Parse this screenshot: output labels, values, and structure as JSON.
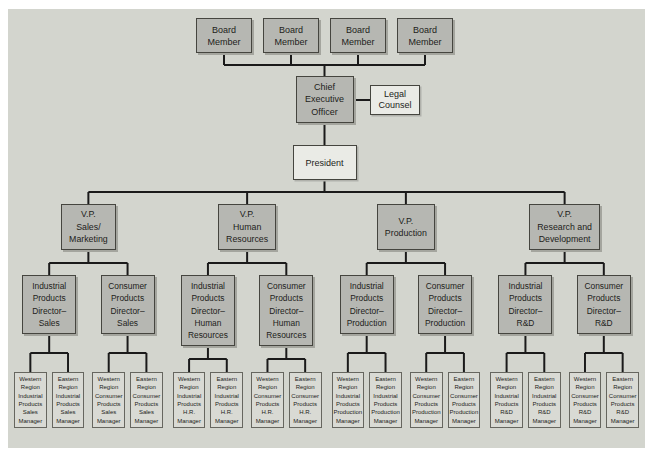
{
  "colors": {
    "panel_bg": "#d3d5ce",
    "box_fill_gray": "#b6b7b2",
    "box_fill_light": "#eaebe6",
    "box_fill_manager": "#d9dad4",
    "box_border": "#45453f",
    "connector_line": "#1a1a1a"
  },
  "org": {
    "board": [
      "Board\nMember",
      "Board\nMember",
      "Board\nMember",
      "Board\nMember"
    ],
    "ceo": "Chief\nExecutive\nOfficer",
    "legal_counsel": "Legal\nCounsel",
    "president": "President",
    "divisions": [
      {
        "vp": "V.P.\nSales/\nMarketing",
        "directors": [
          {
            "label": "Industrial\nProducts\nDirector–\nSales",
            "managers": [
              "Western\nRegion\nIndustrial\nProducts\nSales\nManager",
              "Eastern\nRegion\nIndustrial\nProducts\nSales\nManager"
            ]
          },
          {
            "label": "Consumer\nProducts\nDirector–\nSales",
            "managers": [
              "Western\nRegion\nConsumer\nProducts\nSales\nManager",
              "Eastern\nRegion\nConsumer\nProducts\nSales\nManager"
            ]
          }
        ]
      },
      {
        "vp": "V.P.\nHuman\nResources",
        "directors": [
          {
            "label": "Industrial\nProducts\nDirector–\nHuman\nResources",
            "managers": [
              "Western\nRegion\nIndustrial\nProducts\nH.R.\nManager",
              "Eastern\nRegion\nIndustrial\nProducts\nH.R.\nManager"
            ]
          },
          {
            "label": "Consumer\nProducts\nDirector–\nHuman\nResources",
            "managers": [
              "Western\nRegion\nConsumer\nProducts\nH.R.\nManager",
              "Eastern\nRegion\nConsumer\nProducts\nH.R.\nManager"
            ]
          }
        ]
      },
      {
        "vp": "V.P.\nProduction",
        "directors": [
          {
            "label": "Industrial\nProducts\nDirector–\nProduction",
            "managers": [
              "Western\nRegion\nIndustrial\nProducts\nProduction\nManager",
              "Eastern\nRegion\nIndustrial\nProducts\nProduction\nManager"
            ]
          },
          {
            "label": "Consumer\nProducts\nDirector–\nProduction",
            "managers": [
              "Western\nRegion\nConsumer\nProducts\nProduction\nManager",
              "Eastern\nRegion\nConsumer\nProducts\nProduction\nManager"
            ]
          }
        ]
      },
      {
        "vp": "V.P.\nResearch and\nDevelopment",
        "directors": [
          {
            "label": "Industrial\nProducts\nDirector–\nR&D",
            "managers": [
              "Western\nRegion\nIndustrial\nProducts\nR&D\nManager",
              "Eastern\nRegion\nIndustrial\nProducts\nR&D\nManager"
            ]
          },
          {
            "label": "Consumer\nProducts\nDirector–\nR&D",
            "managers": [
              "Western\nRegion\nConsumer\nProducts\nR&D\nManager",
              "Eastern\nRegion\nConsumer\nProducts\nR&D\nManager"
            ]
          }
        ]
      }
    ]
  }
}
